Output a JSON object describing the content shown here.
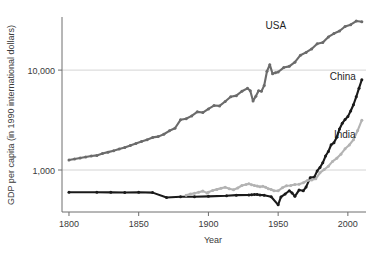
{
  "chart_data": {
    "type": "line",
    "title": "",
    "xlabel": "Year",
    "ylabel": "GDP per capita (in 1990 international dollars)",
    "yscale": "log",
    "xlim": [
      1795,
      2013
    ],
    "ylim": [
      380,
      34000
    ],
    "grid": "horizontal-only",
    "legend_position": "inline-right-of-series",
    "xticks": [
      1800,
      1850,
      1900,
      1950,
      2000
    ],
    "xtick_labels": [
      "1800",
      "1850",
      "1900",
      "1950",
      "2000"
    ],
    "yticks": [
      1000,
      10000
    ],
    "ytick_labels": [
      "1,000",
      "10,000"
    ],
    "colors": {
      "usa": "#6b6b6b",
      "china": "#1a1a1a",
      "india": "#b3b3b3",
      "gridline": "#c9c9c9",
      "axis": "#6e6e6e",
      "text": "#3a3a3a"
    },
    "series": [
      {
        "name": "USA",
        "label": "USA",
        "color": "#6b6b6b",
        "label_x": 1941,
        "label_y": 26000,
        "x": [
          1800,
          1804,
          1808,
          1812,
          1816,
          1820,
          1824,
          1828,
          1832,
          1836,
          1840,
          1844,
          1848,
          1852,
          1856,
          1860,
          1864,
          1868,
          1872,
          1876,
          1880,
          1884,
          1888,
          1892,
          1896,
          1900,
          1904,
          1908,
          1912,
          1916,
          1920,
          1924,
          1928,
          1930,
          1932,
          1934,
          1936,
          1938,
          1940,
          1942,
          1944,
          1946,
          1948,
          1950,
          1954,
          1958,
          1962,
          1966,
          1970,
          1974,
          1978,
          1982,
          1986,
          1990,
          1994,
          1998,
          2002,
          2006,
          2010
        ],
        "y": [
          1257,
          1290,
          1320,
          1350,
          1380,
          1400,
          1460,
          1510,
          1560,
          1620,
          1680,
          1760,
          1840,
          1930,
          2010,
          2120,
          2160,
          2280,
          2470,
          2620,
          3180,
          3260,
          3480,
          3820,
          3760,
          4091,
          4420,
          4380,
          4850,
          5420,
          5550,
          6150,
          6570,
          6200,
          4900,
          5470,
          6200,
          6130,
          7010,
          9740,
          11330,
          9197,
          9400,
          9561,
          10600,
          10900,
          12000,
          14100,
          15030,
          16280,
          18370,
          18900,
          21500,
          23201,
          24600,
          27300,
          28500,
          31000,
          30500
        ]
      },
      {
        "name": "China",
        "label": "China",
        "color": "#1a1a1a",
        "label_x": 1987,
        "label_y": 7900,
        "x": [
          1800,
          1820,
          1830,
          1840,
          1850,
          1860,
          1870,
          1880,
          1890,
          1900,
          1913,
          1920,
          1929,
          1931,
          1933,
          1935,
          1937,
          1940,
          1945,
          1950,
          1952,
          1955,
          1958,
          1960,
          1962,
          1965,
          1968,
          1970,
          1973,
          1976,
          1978,
          1980,
          1982,
          1984,
          1986,
          1988,
          1990,
          1992,
          1994,
          1996,
          1998,
          2000,
          2002,
          2004,
          2006,
          2008,
          2010
        ],
        "y": [
          600,
          600,
          598,
          596,
          600,
          594,
          530,
          540,
          540,
          545,
          552,
          560,
          562,
          565,
          568,
          570,
          562,
          560,
          540,
          448,
          538,
          575,
          620,
          590,
          545,
          630,
          620,
          675,
          839,
          853,
          979,
          1061,
          1180,
          1380,
          1530,
          1790,
          1871,
          2130,
          2570,
          2940,
          3200,
          3425,
          3900,
          4500,
          5400,
          6600,
          8000
        ]
      },
      {
        "name": "India",
        "label": "India",
        "color": "#b3b3b3",
        "label_x": 1990,
        "label_y": 2100,
        "x": [
          1884,
          1887,
          1890,
          1893,
          1896,
          1899,
          1900,
          1903,
          1906,
          1909,
          1912,
          1915,
          1918,
          1921,
          1924,
          1927,
          1929,
          1931,
          1933,
          1935,
          1937,
          1939,
          1941,
          1943,
          1945,
          1947,
          1950,
          1953,
          1956,
          1959,
          1962,
          1965,
          1968,
          1971,
          1974,
          1977,
          1980,
          1983,
          1986,
          1989,
          1992,
          1995,
          1998,
          2001,
          2004,
          2007,
          2010
        ],
        "y": [
          560,
          575,
          584,
          600,
          615,
          590,
          599,
          625,
          640,
          655,
          673,
          650,
          635,
          661,
          700,
          715,
          728,
          712,
          700,
          690,
          680,
          686,
          672,
          650,
          640,
          620,
          619,
          665,
          695,
          700,
          717,
          720,
          745,
          785,
          795,
          820,
          938,
          1010,
          1090,
          1220,
          1310,
          1440,
          1630,
          1780,
          2010,
          2480,
          3150
        ]
      }
    ]
  },
  "axes": {
    "x_axis_title": "Year",
    "y_axis_title": "GDP per capita (in 1990 international dollars)"
  }
}
